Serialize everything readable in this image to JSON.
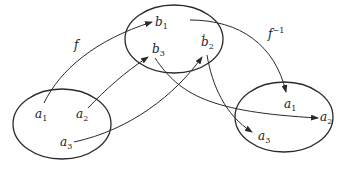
{
  "diagram": {
    "title": "",
    "sets": [
      {
        "id": "A_left",
        "elements": [
          "a1",
          "a2",
          "a3"
        ]
      },
      {
        "id": "B",
        "elements": [
          "b1",
          "b2",
          "b3"
        ]
      },
      {
        "id": "A_right",
        "elements": [
          "a1",
          "a2",
          "a3"
        ]
      }
    ],
    "labels": {
      "f": "f",
      "finv_base": "f",
      "finv_sup": "−1",
      "a": "a",
      "b": "b",
      "s1": "1",
      "s2": "2",
      "s3": "3"
    },
    "mapping_f": [
      {
        "from": "a1",
        "to": "b1"
      },
      {
        "from": "a2",
        "to": "b3"
      },
      {
        "from": "a3",
        "to": "b2"
      }
    ],
    "mapping_f_inverse": [
      {
        "from": "b1",
        "to": "a1"
      },
      {
        "from": "b3",
        "to": "a2"
      },
      {
        "from": "b2",
        "to": "a3"
      }
    ],
    "colors": {
      "stroke": "#2a2a2a",
      "background": "#ffffff"
    }
  }
}
